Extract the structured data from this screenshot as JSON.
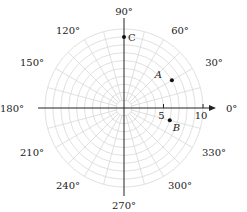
{
  "diagram": {
    "type": "polar-grid",
    "center": {
      "x": 124,
      "y": 108
    },
    "unit_px": 7.9,
    "rings": 10,
    "spoke_step_deg": 15,
    "grid_color": "#d8d8d8",
    "axis_color": "#222222",
    "angle_labels": [
      {
        "deg": 0,
        "text": "0°"
      },
      {
        "deg": 30,
        "text": "30°"
      },
      {
        "deg": 60,
        "text": "60°"
      },
      {
        "deg": 90,
        "text": "90°"
      },
      {
        "deg": 120,
        "text": "120°"
      },
      {
        "deg": 150,
        "text": "150°"
      },
      {
        "deg": 180,
        "text": "180°"
      },
      {
        "deg": 210,
        "text": "210°"
      },
      {
        "deg": 240,
        "text": "240°"
      },
      {
        "deg": 270,
        "text": "270°"
      },
      {
        "deg": 300,
        "text": "300°"
      },
      {
        "deg": 330,
        "text": "330°"
      }
    ],
    "radial_ticks": [
      {
        "r": 5,
        "text": "5"
      },
      {
        "r": 10,
        "text": "10"
      }
    ],
    "points": [
      {
        "name": "A",
        "r": 7,
        "deg": 30
      },
      {
        "name": "B",
        "r": 6,
        "deg": 345
      },
      {
        "name": "C",
        "r": 9,
        "deg": 90
      }
    ]
  }
}
